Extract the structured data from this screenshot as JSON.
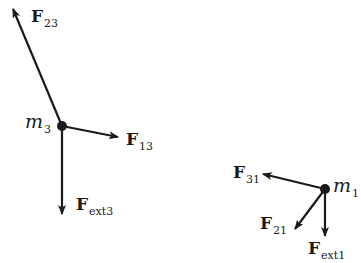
{
  "diagram": {
    "colors": {
      "ink": "#1a1a1a",
      "background": "#ffffff"
    },
    "masses": [
      {
        "id": "m3",
        "symbol": "m",
        "subscript": "3",
        "x": 62,
        "y": 126
      },
      {
        "id": "m1",
        "symbol": "m",
        "subscript": "1",
        "x": 325,
        "y": 189
      }
    ],
    "forces": [
      {
        "id": "F23",
        "symbol": "F",
        "subscript": "23",
        "from": "m3",
        "tip": [
          13,
          9
        ]
      },
      {
        "id": "F13",
        "symbol": "F",
        "subscript": "13",
        "from": "m3",
        "tip": [
          118,
          137
        ]
      },
      {
        "id": "Fext3",
        "symbol": "F",
        "subscript": "ext3",
        "from": "m3",
        "tip": [
          62,
          214
        ]
      },
      {
        "id": "F31",
        "symbol": "F",
        "subscript": "31",
        "from": "m1",
        "tip": [
          263,
          174
        ]
      },
      {
        "id": "F21",
        "symbol": "F",
        "subscript": "21",
        "from": "m1",
        "tip": [
          295,
          229
        ]
      },
      {
        "id": "Fext1",
        "symbol": "F",
        "subscript": "ext1",
        "from": "m1",
        "tip": [
          325,
          236
        ]
      }
    ]
  }
}
